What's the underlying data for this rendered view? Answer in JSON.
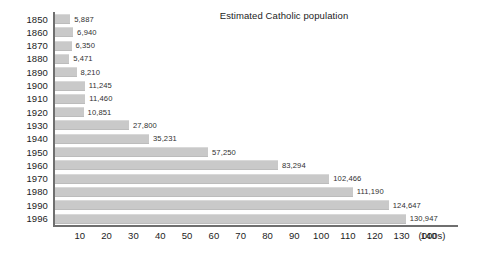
{
  "chart_data": {
    "type": "bar",
    "orientation": "horizontal",
    "title": "Estimated Catholic population",
    "xlabel": "(000s)",
    "ylabel": "",
    "categories": [
      "1850",
      "1860",
      "1870",
      "1880",
      "1890",
      "1900",
      "1910",
      "1920",
      "1930",
      "1940",
      "1950",
      "1960",
      "1970",
      "1980",
      "1990",
      "1996"
    ],
    "values": [
      5887,
      6940,
      6350,
      5471,
      8210,
      11245,
      11460,
      10851,
      27800,
      35231,
      57250,
      83294,
      102466,
      111190,
      124647,
      130947
    ],
    "value_labels": [
      "5,887",
      "6,940",
      "6,350",
      "5,471",
      "8,210",
      "11,245",
      "11,460",
      "10,851",
      "27,800",
      "35,231",
      "57,250",
      "83,294",
      "102,466",
      "111,190",
      "124,647",
      "130,947"
    ],
    "xlim": [
      0,
      150
    ],
    "xticks": [
      10,
      20,
      30,
      40,
      50,
      60,
      70,
      80,
      90,
      100,
      110,
      120,
      130,
      140
    ],
    "xtick_labels": [
      "10",
      "20",
      "30",
      "40",
      "50",
      "60",
      "70",
      "80",
      "90",
      "100",
      "110",
      "120",
      "130",
      "140"
    ],
    "unit_note": "(000s)",
    "grid": false,
    "legend": null,
    "bar_color": "#c9c9c9",
    "axis_color": "#6f6f6f",
    "text_color": "#1c1c1c",
    "value_scale_divisor": 1000
  }
}
